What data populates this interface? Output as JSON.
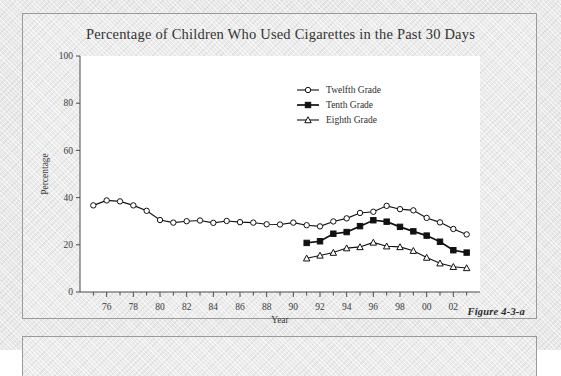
{
  "figure": {
    "caption": "Figure 4-3-a"
  },
  "chart_data": {
    "type": "line",
    "title": "Percentage of Children Who Used Cigarettes in the Past 30 Days",
    "xlabel": "Year",
    "ylabel": "Percentage",
    "ylim": [
      0,
      100
    ],
    "ytick_values": [
      0,
      20,
      40,
      60,
      80,
      100
    ],
    "ytick_labels": [
      "0",
      "20",
      "40",
      "60",
      "80",
      "100"
    ],
    "xlim": [
      1974,
      2004
    ],
    "xtick_values": [
      1976,
      1978,
      1980,
      1982,
      1984,
      1986,
      1988,
      1990,
      1992,
      1994,
      1996,
      1998,
      2000,
      2002
    ],
    "xtick_labels": [
      "76",
      "78",
      "80",
      "82",
      "84",
      "86",
      "88",
      "90",
      "92",
      "94",
      "96",
      "98",
      "00",
      "02"
    ],
    "xtick_minor_every": 1,
    "grid": false,
    "legend_position": "upper-center-right",
    "series": [
      {
        "name": "Twelfth Grade",
        "marker": "open-circle",
        "color": "#111111",
        "x": [
          1975,
          1976,
          1977,
          1978,
          1979,
          1980,
          1981,
          1982,
          1983,
          1984,
          1985,
          1986,
          1987,
          1988,
          1989,
          1990,
          1991,
          1992,
          1993,
          1994,
          1995,
          1996,
          1997,
          1998,
          1999,
          2000,
          2001,
          2002,
          2003
        ],
        "y": [
          36.7,
          38.8,
          38.4,
          36.7,
          34.4,
          30.5,
          29.4,
          30.0,
          30.3,
          29.3,
          30.1,
          29.6,
          29.4,
          28.7,
          28.6,
          29.4,
          28.3,
          27.8,
          29.9,
          31.2,
          33.5,
          34.0,
          36.5,
          35.1,
          34.6,
          31.4,
          29.5,
          26.7,
          24.4
        ]
      },
      {
        "name": "Tenth Grade",
        "marker": "filled-square",
        "color": "#111111",
        "x": [
          1991,
          1992,
          1993,
          1994,
          1995,
          1996,
          1997,
          1998,
          1999,
          2000,
          2001,
          2002,
          2003
        ],
        "y": [
          20.8,
          21.5,
          24.7,
          25.4,
          27.9,
          30.4,
          29.8,
          27.6,
          25.7,
          23.9,
          21.3,
          17.7,
          16.7
        ]
      },
      {
        "name": "Eighth Grade",
        "marker": "open-triangle",
        "color": "#111111",
        "x": [
          1991,
          1992,
          1993,
          1994,
          1995,
          1996,
          1997,
          1998,
          1999,
          2000,
          2001,
          2002,
          2003
        ],
        "y": [
          14.3,
          15.5,
          16.7,
          18.6,
          19.1,
          21.0,
          19.4,
          19.1,
          17.5,
          14.6,
          12.2,
          10.7,
          10.2
        ]
      }
    ]
  },
  "legend": {
    "items": [
      {
        "label": "Twelfth Grade",
        "marker": "open-circle"
      },
      {
        "label": "Tenth Grade",
        "marker": "filled-square"
      },
      {
        "label": "Eighth Grade",
        "marker": "open-triangle"
      }
    ]
  }
}
